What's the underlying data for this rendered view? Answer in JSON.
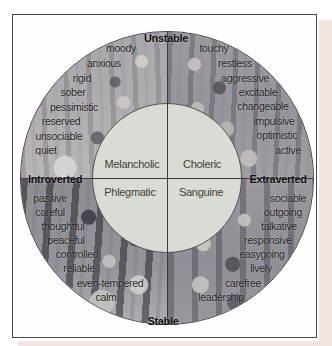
{
  "figure": {
    "poles": {
      "top": "Unstable",
      "bottom": "Stable",
      "left": "Introverted",
      "right": "Extraverted"
    },
    "temperaments": {
      "top_left": "Melancholic",
      "top_right": "Choleric",
      "bottom_left": "Phlegmatic",
      "bottom_right": "Sanguine"
    },
    "traits": {
      "top_left": [
        "moody",
        "anxious",
        "rigid",
        "sober",
        "pessimistic",
        "reserved",
        "unsociable",
        "quiet"
      ],
      "top_right": [
        "touchy",
        "restless",
        "aggressive",
        "excitable",
        "changeable",
        "impulsive",
        "optimistic",
        "active"
      ],
      "bottom_left": [
        "passive",
        "careful",
        "thoughtful",
        "peaceful",
        "controlled",
        "reliable",
        "even-tempered",
        "calm"
      ],
      "bottom_right": [
        "sociable",
        "outgoing",
        "talkative",
        "responsive",
        "easygoing",
        "lively",
        "carefree",
        "leadership"
      ]
    },
    "colors": {
      "inner_circle": "#d9dcd4",
      "axis_line": "#3a3a3a",
      "frame_border": "#4a4a4a",
      "page_accent": "#f2e5df",
      "pole_text": "#0e0e0e",
      "trait_text": "#1e1e1e",
      "temperament_text": "#3c3f38"
    }
  }
}
